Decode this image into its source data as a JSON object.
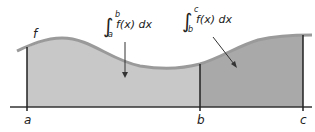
{
  "figure": {
    "function_label": "f",
    "axis_labels": [
      "a",
      "b",
      "c"
    ],
    "integral_1": {
      "lower": "a",
      "upper": "b",
      "integrand": "f(x) dx"
    },
    "integral_2": {
      "lower": "b",
      "upper": "c",
      "integrand": "f(x) dx"
    },
    "colors": {
      "region_ab": "#c8c8c8",
      "region_bc": "#a9a9a9",
      "curve": "#9a9a9a",
      "axis": "#333333",
      "bounds": "#222222"
    }
  }
}
